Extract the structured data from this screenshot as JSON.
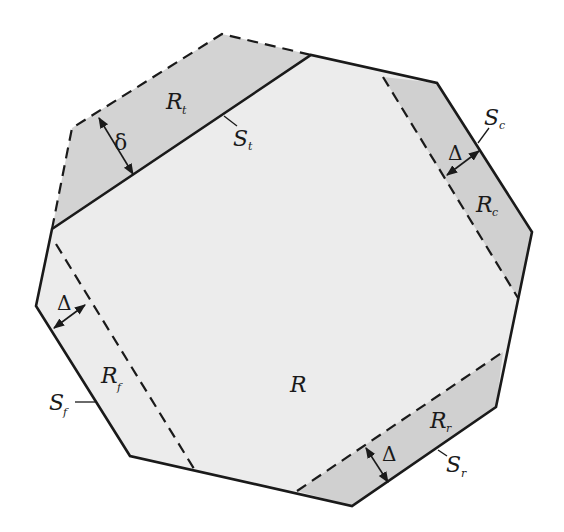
{
  "diagram": {
    "colors": {
      "main_fill": "#ececec",
      "strip_fill": "#d0d0d0",
      "stroke": "#1a1a1a",
      "background": "#ffffff"
    },
    "regions": {
      "main": {
        "letter": "R",
        "sub": ""
      },
      "top": {
        "letter": "R",
        "sub": "t"
      },
      "right": {
        "letter": "R",
        "sub": "c"
      },
      "left": {
        "letter": "R",
        "sub": "f"
      },
      "bottom": {
        "letter": "R",
        "sub": "r"
      }
    },
    "segments": {
      "top": {
        "letter": "S",
        "sub": "t"
      },
      "right": {
        "letter": "S",
        "sub": "c"
      },
      "left": {
        "letter": "S",
        "sub": "f"
      },
      "bottom": {
        "letter": "S",
        "sub": "r"
      }
    },
    "widths": {
      "top": "δ",
      "right": "Δ",
      "left": "Δ",
      "bottom": "Δ"
    }
  }
}
